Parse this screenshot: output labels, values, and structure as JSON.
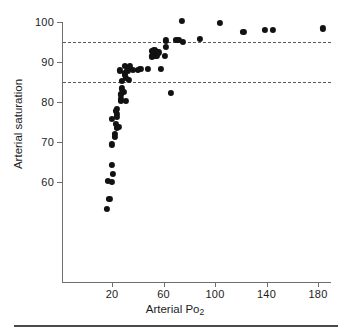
{
  "chart_data": {
    "type": "scatter",
    "title": "",
    "xlabel": "Arterial Po2",
    "xlabel_base": "Arterial Po",
    "xlabel_sub": "2",
    "ylabel": "Arterial saturation",
    "xlim": [
      0,
      190
    ],
    "ylim": [
      50,
      102
    ],
    "xticks": [
      20,
      60,
      100,
      140,
      180
    ],
    "yticks": [
      60,
      70,
      80,
      90,
      100
    ],
    "xtick_labels": [
      "20",
      "60",
      "100",
      "140",
      "180"
    ],
    "ytick_labels": [
      "60",
      "70",
      "80",
      "90",
      "100"
    ],
    "grid": false,
    "legend": "none",
    "marker_color": "#121212",
    "axis_color": "#6f6f6f",
    "reference_lines": [
      {
        "name": "upper-reference-line",
        "y": 95,
        "style": "dashed",
        "color": "#5b5b5b"
      },
      {
        "name": "lower-reference-line",
        "y": 85,
        "style": "dashed",
        "color": "#5b5b5b"
      }
    ],
    "points": [
      {
        "x": 16,
        "y": 53.3
      },
      {
        "x": 18,
        "y": 55.8
      },
      {
        "x": 17,
        "y": 60.3
      },
      {
        "x": 20,
        "y": 60.1
      },
      {
        "x": 21,
        "y": 62.1
      },
      {
        "x": 20,
        "y": 64.2
      },
      {
        "x": 20,
        "y": 69.4
      },
      {
        "x": 22,
        "y": 71.2
      },
      {
        "x": 22,
        "y": 72.0
      },
      {
        "x": 24,
        "y": 73.6
      },
      {
        "x": 25,
        "y": 73.7
      },
      {
        "x": 23,
        "y": 74.6
      },
      {
        "x": 20,
        "y": 75.8
      },
      {
        "x": 24,
        "y": 76.3
      },
      {
        "x": 24,
        "y": 77.0
      },
      {
        "x": 23,
        "y": 77.8
      },
      {
        "x": 24,
        "y": 78.2
      },
      {
        "x": 27,
        "y": 80.2
      },
      {
        "x": 27,
        "y": 80.7
      },
      {
        "x": 31,
        "y": 80.3
      },
      {
        "x": 27,
        "y": 81.9
      },
      {
        "x": 29,
        "y": 82.6
      },
      {
        "x": 28,
        "y": 83.4
      },
      {
        "x": 66,
        "y": 82.3
      },
      {
        "x": 28,
        "y": 85.3
      },
      {
        "x": 33,
        "y": 85.5
      },
      {
        "x": 31,
        "y": 86.1
      },
      {
        "x": 30,
        "y": 86.7
      },
      {
        "x": 30,
        "y": 87.2
      },
      {
        "x": 26,
        "y": 87.9
      },
      {
        "x": 32,
        "y": 87.8
      },
      {
        "x": 36,
        "y": 88.0
      },
      {
        "x": 40,
        "y": 88.1
      },
      {
        "x": 42,
        "y": 88.2
      },
      {
        "x": 48,
        "y": 88.2
      },
      {
        "x": 58,
        "y": 88.2
      },
      {
        "x": 30,
        "y": 89.1
      },
      {
        "x": 34,
        "y": 88.9
      },
      {
        "x": 51,
        "y": 91.4
      },
      {
        "x": 53,
        "y": 91.5
      },
      {
        "x": 55,
        "y": 91.6
      },
      {
        "x": 61,
        "y": 91.6
      },
      {
        "x": 52,
        "y": 92.2
      },
      {
        "x": 54,
        "y": 92.3
      },
      {
        "x": 56,
        "y": 92.4
      },
      {
        "x": 51,
        "y": 92.8
      },
      {
        "x": 53,
        "y": 93.0
      },
      {
        "x": 62,
        "y": 93.7
      },
      {
        "x": 62,
        "y": 95.4
      },
      {
        "x": 70,
        "y": 95.6
      },
      {
        "x": 72,
        "y": 95.6
      },
      {
        "x": 75,
        "y": 95.0
      },
      {
        "x": 88,
        "y": 95.8
      },
      {
        "x": 74,
        "y": 100.3
      },
      {
        "x": 104,
        "y": 99.8
      },
      {
        "x": 122,
        "y": 97.5
      },
      {
        "x": 139,
        "y": 98.1
      },
      {
        "x": 145,
        "y": 98.1
      },
      {
        "x": 184,
        "y": 98.4
      }
    ]
  }
}
